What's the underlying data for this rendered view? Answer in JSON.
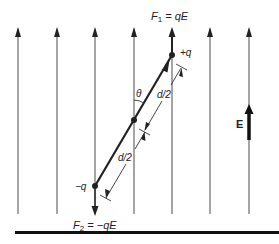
{
  "diagram": {
    "field_label": "E",
    "labels": {
      "f1_symbol": "F",
      "f1_sub": "1",
      "f1_eq": " = qE",
      "f2_symbol": "F",
      "f2_sub": "2",
      "f2_eq": " = −qE",
      "plus_charge": "+q",
      "minus_charge": "−q",
      "angle": "θ",
      "half_dist_top": "d/2",
      "half_dist_bottom": "d/2"
    },
    "field_lines_x": [
      18,
      57,
      95,
      134,
      172,
      210,
      249
    ],
    "colors": {
      "line": "#3a3a3a",
      "text": "#222222",
      "background": "#ffffff"
    }
  }
}
